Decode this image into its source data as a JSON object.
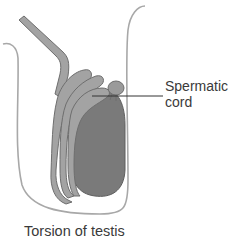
{
  "diagram": {
    "title": "Torsion of testis",
    "labels": {
      "spermatic_cord_line1": "Spermatic",
      "spermatic_cord_line2": "cord"
    },
    "colors": {
      "scrotum_outline": "#a8a8a8",
      "testis_fill": "#7a7a7a",
      "testis_stroke": "#5e5e5e",
      "cord_fill": "#a3a3a3",
      "cord_stroke": "#6e6e6e",
      "appendage_fill": "#9a9a9a",
      "leader_line": "#333333",
      "text": "#3a3a3a",
      "background": "#ffffff"
    }
  }
}
